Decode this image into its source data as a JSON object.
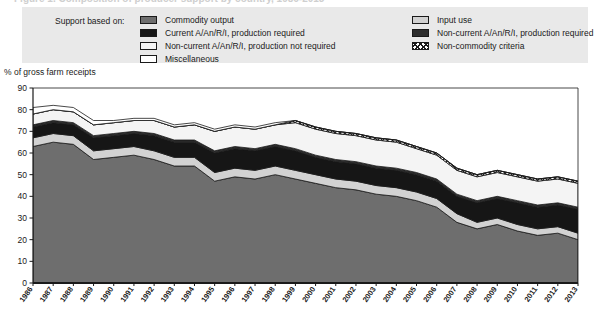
{
  "figure": {
    "cutoff_title": "Figure 1. Composition of producer support by country, 1986-2013",
    "axis_caption": "% of gross farm receipts"
  },
  "legend": {
    "intro_label": "Support based on:",
    "column1": [
      {
        "label": "Commodity output",
        "swatch": "commodity-output-swatch",
        "color": "#6e6e6e"
      },
      {
        "label": "Current A/An/R/I, production required",
        "swatch": "current-arin-required-swatch",
        "color": "#161616"
      },
      {
        "label": "Non-current A/An/R/I, production not required",
        "swatch": "non-current-arin-not-required-swatch",
        "color": "#f4f4f4"
      },
      {
        "label": "Miscellaneous",
        "swatch": "miscellaneous-swatch",
        "color": "#ffffff"
      }
    ],
    "column2": [
      {
        "label": "Input use",
        "swatch": "input-use-swatch",
        "color": "#d2d2d2"
      },
      {
        "label": "Non-current A/An/R/I, production required",
        "swatch": "non-current-arin-required-swatch",
        "color": "#2e2e2e"
      },
      {
        "label": "Non-commodity criteria",
        "swatch": "non-commodity-criteria-swatch",
        "color": "#ffffff"
      }
    ]
  },
  "chart_data": {
    "type": "area",
    "stacked": true,
    "title": "",
    "xlabel": "",
    "ylabel": "% of gross farm receipts",
    "ylim": [
      0,
      90
    ],
    "ytick_step": 10,
    "yticks": [
      0,
      10,
      20,
      30,
      40,
      50,
      60,
      70,
      80,
      90
    ],
    "grid": false,
    "legend_position": "top",
    "categories": [
      "1986",
      "1987",
      "1988",
      "1989",
      "1990",
      "1991",
      "1992",
      "1993",
      "1994",
      "1995",
      "1996",
      "1997",
      "1998",
      "1999",
      "2000",
      "2001",
      "2002",
      "2003",
      "2004",
      "2005",
      "2006",
      "2007",
      "2008",
      "2009",
      "2010",
      "2011",
      "2012",
      "2013"
    ],
    "series": [
      {
        "name": "Commodity output",
        "color": "#6e6e6e",
        "values": [
          63,
          65,
          64,
          57,
          58,
          59,
          57,
          54,
          54,
          47,
          49,
          48,
          50,
          48,
          46,
          44,
          43,
          41,
          40,
          38,
          35,
          28,
          25,
          27,
          24,
          22,
          23,
          20
        ]
      },
      {
        "name": "Input use",
        "color": "#d2d2d2",
        "values": [
          4,
          4,
          4,
          4,
          4,
          4,
          4,
          4,
          4,
          4,
          4,
          4,
          4,
          4,
          4,
          4,
          4,
          4,
          4,
          4,
          4,
          4,
          3,
          3,
          3,
          3,
          3,
          3
        ]
      },
      {
        "name": "Current A/An/R/I, production required",
        "color": "#161616",
        "values": [
          5,
          5,
          5,
          6,
          6,
          6,
          7,
          7,
          7,
          9,
          9,
          9,
          9,
          9,
          8,
          8,
          8,
          8,
          8,
          8,
          8,
          8,
          9,
          9,
          10,
          10,
          10,
          11
        ]
      },
      {
        "name": "Non-current A/An/R/I, production required",
        "color": "#2e2e2e",
        "values": [
          1,
          1,
          1,
          1,
          1,
          1,
          1,
          1,
          1,
          1,
          1,
          1,
          1,
          1,
          1,
          1,
          1,
          1,
          1,
          1,
          1,
          1,
          1,
          1,
          1,
          1,
          1,
          1
        ]
      },
      {
        "name": "Non-current A/An/R/I, production not required",
        "color": "#f4f4f4",
        "values": [
          5,
          5,
          5,
          5,
          5,
          5,
          6,
          6,
          7,
          9,
          9,
          9,
          9,
          12,
          12,
          12,
          12,
          12,
          12,
          11,
          11,
          11,
          11,
          11,
          11,
          11,
          11,
          11
        ]
      },
      {
        "name": "Non-commodity criteria",
        "color": "#ffffff",
        "pattern": "crosshatch",
        "values": [
          0,
          0,
          0,
          0,
          0,
          0,
          0,
          0,
          0,
          0,
          0,
          0,
          0,
          1,
          1,
          1,
          1,
          1,
          1,
          1,
          1,
          1,
          1,
          1,
          1,
          1,
          1,
          1
        ]
      },
      {
        "name": "Miscellaneous",
        "color": "#ffffff",
        "values": [
          3,
          2,
          2,
          2,
          1,
          1,
          1,
          1,
          1,
          1,
          1,
          1,
          1,
          0,
          0,
          0,
          0,
          0,
          0,
          0,
          0,
          0,
          0,
          0,
          0,
          0,
          0,
          0
        ]
      }
    ],
    "totals": [
      81,
      82,
      81,
      75,
      75,
      76,
      76,
      73,
      74,
      71,
      73,
      72,
      74,
      75,
      72,
      70,
      69,
      67,
      66,
      63,
      60,
      53,
      50,
      52,
      50,
      48,
      49,
      47
    ]
  }
}
